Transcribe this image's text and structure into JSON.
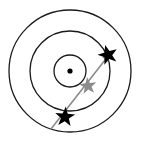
{
  "figure": {
    "title": "Concentric orbital rings with star markers along a trajectory arrow",
    "width": 142,
    "height": 150,
    "background_color": "#ffffff"
  },
  "chart_data": {
    "type": "scatter",
    "title": "Concentric orbital rings with star markers along a trajectory arrow",
    "xlabel": "",
    "ylabel": "",
    "xlim": [
      0,
      142
    ],
    "ylim": [
      0,
      150
    ],
    "grid": false,
    "legend": "none",
    "center": {
      "x": 70,
      "y": 71
    },
    "rings": [
      {
        "name": "outer-ring",
        "radius": 61,
        "stroke": "#1a1a1a",
        "stroke_width": 1.3,
        "fill": "none"
      },
      {
        "name": "middle-ring",
        "radius": 40,
        "stroke": "#1a1a1a",
        "stroke_width": 1.3,
        "fill": "none"
      },
      {
        "name": "inner-ring",
        "radius": 16,
        "stroke": "#1a1a1a",
        "stroke_width": 1.3,
        "fill": "none"
      }
    ],
    "center_point": {
      "x": 70,
      "y": 71,
      "radius": 2.6,
      "color": "#000000"
    },
    "trajectory": {
      "name": "trajectory-arrow",
      "start": {
        "x": 51,
        "y": 129
      },
      "end": {
        "x": 112,
        "y": 51
      },
      "color": "#8c8c8c",
      "width": 1.6,
      "arrowhead": "end",
      "arrowhead_length": 11,
      "arrowhead_width": 7
    },
    "markers": [
      {
        "name": "star-outer-upper-right",
        "x": 108,
        "y": 55,
        "size": 10.5,
        "color": "#000000",
        "rotation": -16
      },
      {
        "name": "star-middle-gray",
        "x": 88,
        "y": 86,
        "size": 9.0,
        "color": "#8c8c8c",
        "rotation": -6
      },
      {
        "name": "star-outer-lower-left",
        "x": 65,
        "y": 117,
        "size": 10.5,
        "color": "#000000",
        "rotation": 4
      }
    ]
  }
}
